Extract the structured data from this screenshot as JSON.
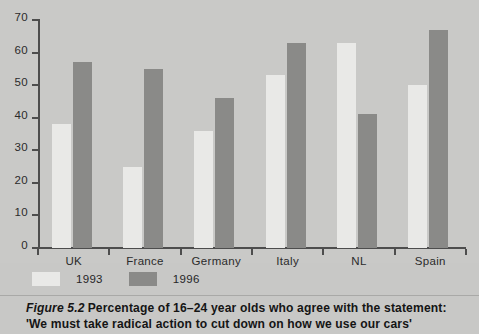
{
  "figure": {
    "number_label": "Figure 5.2",
    "caption_line1": "Percentage of 16–24 year olds who agree with the statement:",
    "caption_line2": "'We must take radical action to cut down on how we use our cars'"
  },
  "legend": {
    "items": [
      {
        "label": "1993",
        "color": "#e9e9e7"
      },
      {
        "label": "1996",
        "color": "#8a8a88"
      }
    ]
  },
  "axis": {
    "y_ticks": [
      "70",
      "60",
      "50",
      "40",
      "30",
      "20",
      "10",
      "0"
    ],
    "x_ticks": [
      "UK",
      "France",
      "Germany",
      "Italy",
      "NL",
      "Spain"
    ]
  },
  "chart_data": {
    "type": "bar",
    "title": "Percentage of 16–24 year olds who agree with the statement: 'We must take radical action to cut down on how we use our cars'",
    "xlabel": "",
    "ylabel": "",
    "ylim": [
      0,
      70
    ],
    "ytick_values": [
      0,
      10,
      20,
      30,
      40,
      50,
      60,
      70
    ],
    "grid": false,
    "legend_position": "below-left",
    "categories": [
      "UK",
      "France",
      "Germany",
      "Italy",
      "NL",
      "Spain"
    ],
    "series": [
      {
        "name": "1993",
        "color": "#e9e9e7",
        "values": [
          38,
          25,
          36,
          53,
          63,
          50
        ]
      },
      {
        "name": "1996",
        "color": "#8a8a88",
        "values": [
          57,
          55,
          46,
          63,
          41,
          67
        ]
      }
    ]
  }
}
